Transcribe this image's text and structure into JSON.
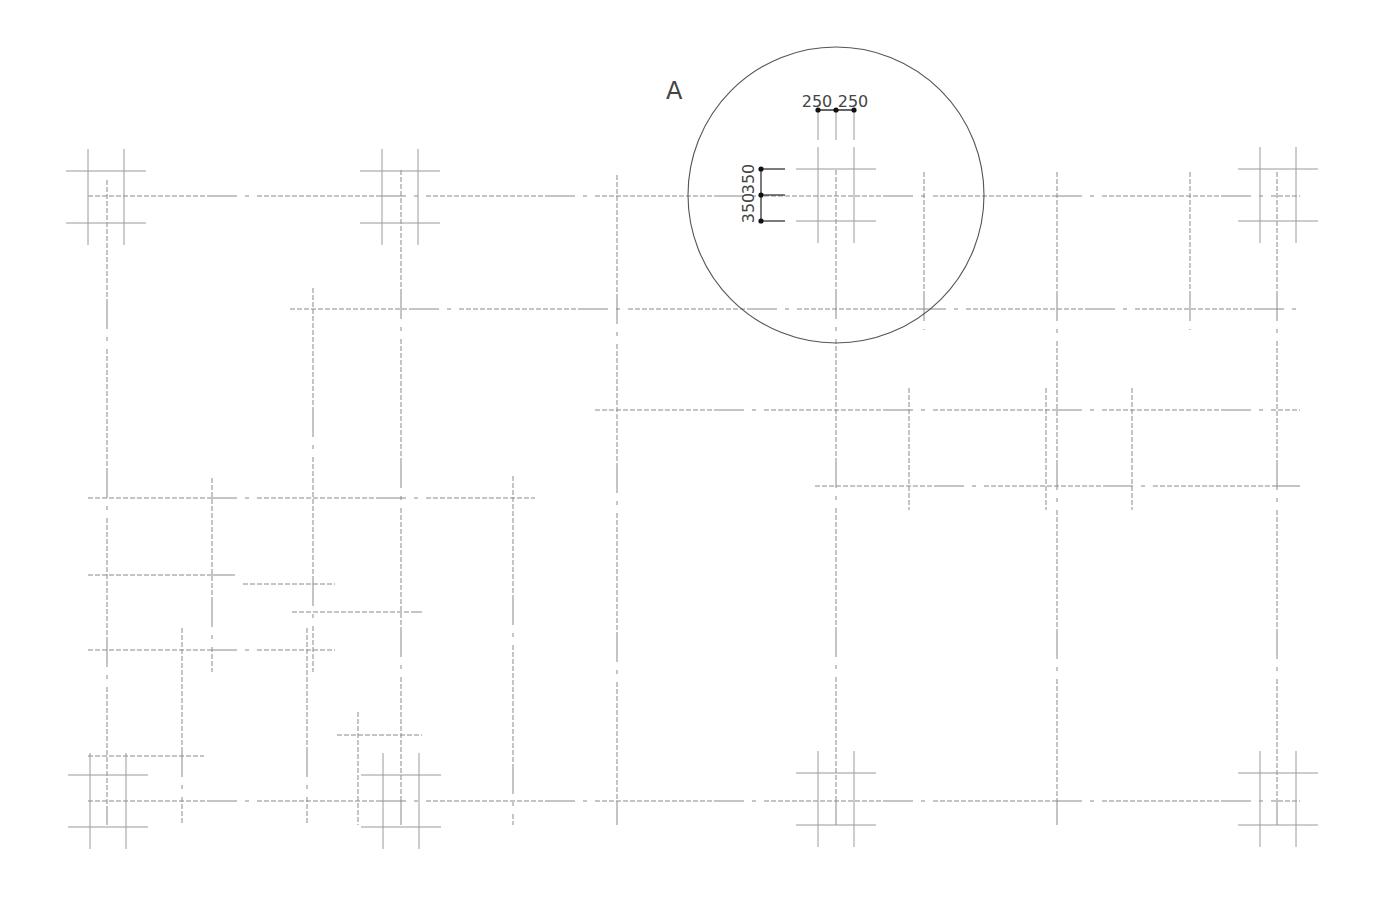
{
  "drawing": {
    "type": "structural-column-grid-plan",
    "callout": {
      "label": "A",
      "cx": 836,
      "cy": 195,
      "r": 148,
      "label_x": 666,
      "label_y": 99
    },
    "dimensions": {
      "horizontal": {
        "values": [
          "250",
          "250"
        ],
        "text_x": [
          817,
          853
        ],
        "text_y": 107,
        "line_y": 110,
        "x": [
          818,
          836,
          854
        ]
      },
      "vertical": {
        "values": [
          "350",
          "350"
        ],
        "text_x": 757,
        "text_y": [
          182,
          211
        ],
        "line_x": 761,
        "y": [
          169,
          195,
          221
        ]
      }
    },
    "h_grid_lines": [
      {
        "y": 196,
        "x1": 88,
        "x2": 1300
      },
      {
        "y": 309,
        "x1": 290,
        "x2": 1300
      },
      {
        "y": 410,
        "x1": 595,
        "x2": 1300
      },
      {
        "y": 486,
        "x1": 815,
        "x2": 1300
      },
      {
        "y": 498,
        "x1": 88,
        "x2": 535
      },
      {
        "y": 575,
        "x1": 88,
        "x2": 235
      },
      {
        "y": 584,
        "x1": 243,
        "x2": 335
      },
      {
        "y": 612,
        "x1": 292,
        "x2": 422
      },
      {
        "y": 650,
        "x1": 88,
        "x2": 335
      },
      {
        "y": 735,
        "x1": 337,
        "x2": 422
      },
      {
        "y": 756,
        "x1": 88,
        "x2": 204
      },
      {
        "y": 801,
        "x1": 88,
        "x2": 1300
      }
    ],
    "v_grid_lines": [
      {
        "x": 107,
        "y1": 180,
        "y2": 825
      },
      {
        "x": 182,
        "y1": 628,
        "y2": 825
      },
      {
        "x": 212,
        "y1": 478,
        "y2": 672
      },
      {
        "x": 313,
        "y1": 288,
        "y2": 672
      },
      {
        "x": 307,
        "y1": 628,
        "y2": 825
      },
      {
        "x": 358,
        "y1": 712,
        "y2": 825
      },
      {
        "x": 401,
        "y1": 170,
        "y2": 825
      },
      {
        "x": 513,
        "y1": 476,
        "y2": 825
      },
      {
        "x": 617,
        "y1": 175,
        "y2": 825
      },
      {
        "x": 836,
        "y1": 170,
        "y2": 825
      },
      {
        "x": 909,
        "y1": 388,
        "y2": 510
      },
      {
        "x": 924,
        "y1": 172,
        "y2": 330
      },
      {
        "x": 1046,
        "y1": 388,
        "y2": 510
      },
      {
        "x": 1057,
        "y1": 172,
        "y2": 825
      },
      {
        "x": 1132,
        "y1": 388,
        "y2": 510
      },
      {
        "x": 1190,
        "y1": 172,
        "y2": 330
      },
      {
        "x": 1277,
        "y1": 172,
        "y2": 825
      }
    ],
    "column_clusters": [
      {
        "name": "col-top-left",
        "cx": 106,
        "cy": 197
      },
      {
        "name": "col-top-2",
        "cx": 400,
        "cy": 197
      },
      {
        "name": "col-top-detail",
        "cx": 836,
        "cy": 195
      },
      {
        "name": "col-top-right",
        "cx": 1278,
        "cy": 195
      },
      {
        "name": "col-bottom-left",
        "cx": 108,
        "cy": 801
      },
      {
        "name": "col-bottom-2",
        "cx": 401,
        "cy": 801
      },
      {
        "name": "col-bottom-3",
        "cx": 836,
        "cy": 799
      },
      {
        "name": "col-bottom-right",
        "cx": 1278,
        "cy": 799
      }
    ],
    "cluster_geom": {
      "half_spacing_x": 18,
      "half_spacing_y": 26,
      "h_len": 40,
      "v_len": 48
    }
  }
}
